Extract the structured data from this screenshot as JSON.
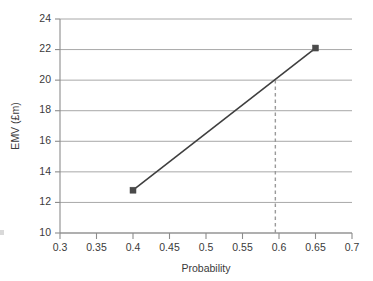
{
  "chart_data": {
    "type": "line",
    "title": "",
    "xlabel": "Probability",
    "ylabel": "EMV (£m)",
    "xlim": [
      0.3,
      0.7
    ],
    "ylim": [
      10,
      24
    ],
    "xticks": [
      0.3,
      0.35,
      0.4,
      0.45,
      0.5,
      0.55,
      0.6,
      0.65,
      0.7
    ],
    "xtick_labels": [
      "0.3",
      "0.35",
      "0.4",
      "0.45",
      "0.5",
      "0.55",
      "0.6",
      "0.65",
      "0.7"
    ],
    "yticks": [
      10,
      12,
      14,
      16,
      18,
      20,
      22,
      24
    ],
    "ytick_labels": [
      "10",
      "12",
      "14",
      "16",
      "18",
      "20",
      "22",
      "24"
    ],
    "grid": "horizontal",
    "legend": "none",
    "series": [
      {
        "name": "EMV",
        "marker": "square",
        "color": "#3f3f3f",
        "x": [
          0.4,
          0.65
        ],
        "values": [
          12.8,
          22.1
        ]
      }
    ],
    "annotations": [
      {
        "name": "breakeven-dashed-line",
        "type": "vline-segment",
        "x": 0.595,
        "y_from": 10,
        "y_to": 20,
        "style": "dashed",
        "color": "#9a9a9a"
      }
    ],
    "colors": {
      "line": "#3f3f3f",
      "marker": "#4a4a4a",
      "grid": "#a8a8a8",
      "axis": "#8c8c8c",
      "text": "#3a3a3a",
      "background": "#ffffff",
      "dashed": "#9a9a9a"
    }
  }
}
